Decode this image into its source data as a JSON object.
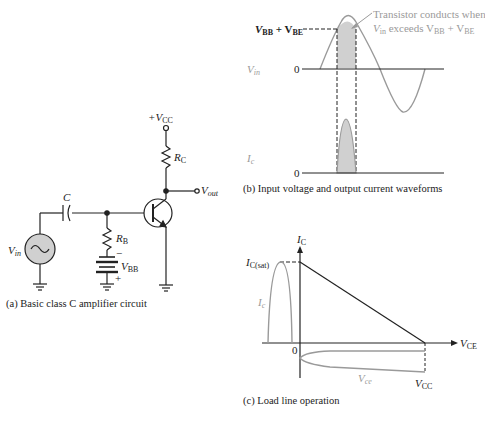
{
  "panel_a": {
    "caption": "(a) Basic class C amplifier circuit",
    "labels": {
      "vcc": "+V",
      "vcc_sub": "CC",
      "rc": "R",
      "rc_sub": "C",
      "vout": "V",
      "vout_sub": "out",
      "c": "C",
      "vin": "V",
      "vin_sub": "in",
      "rb": "R",
      "rb_sub": "B",
      "vbb": "V",
      "vbb_sub": "BB",
      "minus": "−",
      "plus": "+"
    }
  },
  "panel_b": {
    "caption": "(b) Input voltage and output current waveforms",
    "annotation_line1": "Transistor conducts when",
    "annotation_line2_a": "V",
    "annotation_line2_a_sub": "in",
    "annotation_line2_b": " exceeds V",
    "annotation_line2_b_sub": "BB",
    "annotation_line2_c": " + V",
    "annotation_line2_c_sub": "BE",
    "threshold_label_a": "V",
    "threshold_label_a_sub": "BB",
    "threshold_label_b": " + V",
    "threshold_label_b_sub": "BE",
    "vin_label": "V",
    "vin_label_sub": "in",
    "ic_label": "I",
    "ic_label_sub": "c",
    "zero_top": "0",
    "zero_bottom": "0"
  },
  "panel_c": {
    "caption": "(c) Load line operation",
    "y_axis": "I",
    "y_axis_sub": "C",
    "x_axis": "V",
    "x_axis_sub": "CE",
    "icsat": "I",
    "icsat_sub": "C(sat)",
    "ic_curve": "I",
    "ic_curve_sub": "c",
    "vce_curve": "V",
    "vce_curve_sub": "ce",
    "origin": "0",
    "vcc": "V",
    "vcc_sub": "CC"
  },
  "colors": {
    "line": "#222222",
    "waveform": "#9a9a9a",
    "fill": "#d0d0d0"
  }
}
